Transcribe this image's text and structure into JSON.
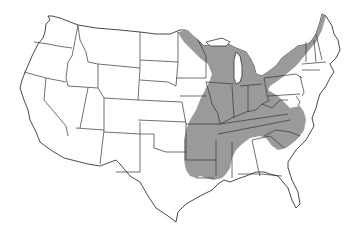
{
  "map": {
    "title": "",
    "subject": "Contiguous United States with shaded range region",
    "colors": {
      "background": "#ffffff",
      "shaded_region": "#9a9a9a",
      "state_lines": "#333333"
    },
    "shaded_region": {
      "description": "Eastern United States range",
      "states_fully_shaded": [
        "Wisconsin",
        "Michigan",
        "Illinois",
        "Indiana",
        "Ohio",
        "Kentucky",
        "Tennessee",
        "West Virginia",
        "Virginia",
        "North Carolina",
        "South Carolina",
        "Arkansas",
        "Mississippi",
        "Alabama (north)",
        "Missouri (east)"
      ],
      "states_partially_shaded": [
        "Minnesota",
        "Iowa (east edge)",
        "Missouri",
        "Oklahoma (east edge)",
        "Texas (east edge)",
        "Louisiana",
        "Georgia (north)",
        "New York",
        "Pennsylvania (west)",
        "Vermont",
        "New Hampshire",
        "Maine (west)"
      ]
    },
    "legend": []
  }
}
